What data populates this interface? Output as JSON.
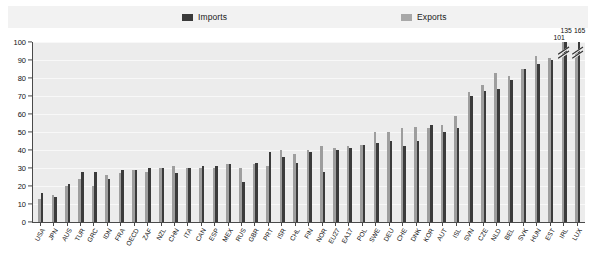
{
  "legend": {
    "imports_label": "Imports",
    "exports_label": "Exports",
    "imports_color": "#3b3b3b",
    "exports_color": "#9e9e9e"
  },
  "axis": {
    "y_ticks": [
      "100",
      "90",
      "80",
      "70",
      "60",
      "50",
      "40",
      "30",
      "20",
      "10",
      "0"
    ],
    "y_min": 0,
    "y_max": 100
  },
  "annotations": [
    {
      "label": "101",
      "category": "IRL",
      "series": "Exports"
    },
    {
      "label": "135",
      "category": "IRL",
      "series": "Imports"
    },
    {
      "label": "165",
      "category": "LUX",
      "series": "Imports"
    }
  ],
  "chart_data": {
    "type": "bar",
    "title": "",
    "subtitle": "",
    "xlabel": "",
    "ylabel": "",
    "ylim": [
      0,
      100
    ],
    "grid": true,
    "legend_position": "top",
    "categories": [
      "USA",
      "JPN",
      "AUS",
      "TUR",
      "GRC",
      "IDN",
      "FRA",
      "OECD",
      "ZAF",
      "NZL",
      "CHN",
      "ITA",
      "CAN",
      "ESP",
      "MEX",
      "RUS",
      "GBR",
      "PRT",
      "ISR",
      "CHL",
      "FIN",
      "NOR",
      "EU27",
      "EA17",
      "POL",
      "SWE",
      "DEU",
      "CHE",
      "DNK",
      "KOR",
      "AUT",
      "ISL",
      "SVN",
      "CZE",
      "NLD",
      "BEL",
      "SVK",
      "HUN",
      "EST",
      "IRL",
      "LUX"
    ],
    "series": [
      {
        "name": "Imports",
        "color": "#3b3b3b",
        "values": [
          16,
          14,
          21,
          28,
          28,
          24,
          29,
          29,
          30,
          30,
          27,
          30,
          31,
          31,
          32,
          22,
          33,
          39,
          36,
          33,
          39,
          28,
          40,
          41,
          43,
          44,
          45,
          42,
          45,
          54,
          50,
          52,
          70,
          73,
          74,
          79,
          85,
          88,
          90,
          135,
          165
        ]
      },
      {
        "name": "Exports",
        "color": "#9e9e9e",
        "values": [
          13,
          15,
          20,
          24,
          20,
          26,
          27,
          29,
          28,
          30,
          31,
          30,
          30,
          30,
          32,
          30,
          32,
          31,
          40,
          38,
          40,
          42,
          41,
          42,
          43,
          50,
          50,
          52,
          53,
          52,
          54,
          59,
          72,
          76,
          83,
          81,
          85,
          92,
          91,
          101,
          95
        ]
      }
    ]
  }
}
